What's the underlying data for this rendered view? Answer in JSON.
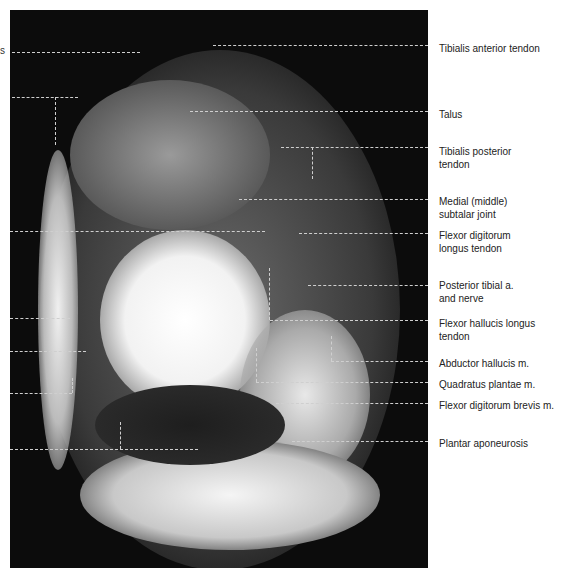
{
  "figure": {
    "left_fragments": [
      "s"
    ],
    "labels": [
      {
        "text": "Tibialis anterior tendon",
        "y": 42
      },
      {
        "text": "Talus",
        "y": 108
      },
      {
        "text": "Tibialis posterior\ntendon",
        "y": 145
      },
      {
        "text": "Medial (middle)\nsubtalar joint",
        "y": 195
      },
      {
        "text": "Flexor digitorum\nlongus tendon",
        "y": 229
      },
      {
        "text": "Posterior tibial a.\nand nerve",
        "y": 279
      },
      {
        "text": "Flexor hallucis longus\ntendon",
        "y": 317
      },
      {
        "text": "Abductor hallucis m.",
        "y": 357
      },
      {
        "text": "Quadratus plantae m.",
        "y": 378
      },
      {
        "text": "Flexor digitorum brevis m.",
        "y": 399
      },
      {
        "text": "Plantar aponeurosis",
        "y": 437
      }
    ]
  }
}
